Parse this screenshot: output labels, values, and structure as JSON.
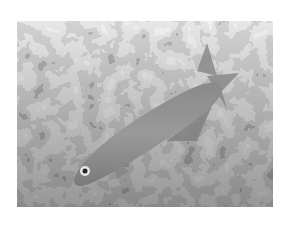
{
  "image": {
    "description": "Grayscale photograph of a slender fish swimming diagonally over rocky coral rubble",
    "subject": "fish",
    "background": "rocky coral rubble",
    "colors": {
      "page_background": "#ffffff",
      "fish_body": "#8c8c8c",
      "rock_light": "#d8d8d8",
      "rock_mid": "#a8a8a8",
      "rock_dark": "#3a3a3a"
    }
  }
}
